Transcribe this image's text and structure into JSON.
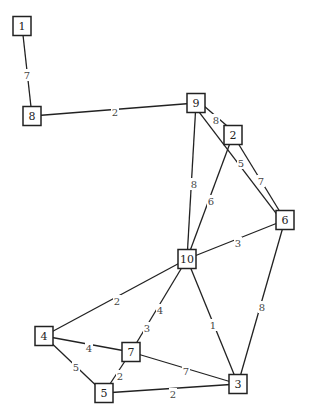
{
  "diagram": {
    "type": "weighted-undirected-graph",
    "nodes": [
      {
        "id": "1",
        "label": "1",
        "x": 22,
        "y": 26
      },
      {
        "id": "8",
        "label": "8",
        "x": 32,
        "y": 116
      },
      {
        "id": "9",
        "label": "9",
        "x": 196,
        "y": 103
      },
      {
        "id": "2",
        "label": "2",
        "x": 233,
        "y": 135
      },
      {
        "id": "6",
        "label": "6",
        "x": 285,
        "y": 220
      },
      {
        "id": "10",
        "label": "10",
        "x": 187,
        "y": 259
      },
      {
        "id": "4",
        "label": "4",
        "x": 44,
        "y": 336
      },
      {
        "id": "7",
        "label": "7",
        "x": 131,
        "y": 352
      },
      {
        "id": "5",
        "label": "5",
        "x": 104,
        "y": 393
      },
      {
        "id": "3",
        "label": "3",
        "x": 238,
        "y": 384
      }
    ],
    "edges": [
      {
        "from": "1",
        "to": "8",
        "weight": "7",
        "lx": 27,
        "ly": 75
      },
      {
        "from": "8",
        "to": "9",
        "weight": "2",
        "lx": 115,
        "ly": 112
      },
      {
        "from": "9",
        "to": "2",
        "weight": "8",
        "lx": 216,
        "ly": 120,
        "offset": -3
      },
      {
        "from": "9",
        "to": "6",
        "weight": "5",
        "lx": 241,
        "ly": 163,
        "offset": 3
      },
      {
        "from": "2",
        "to": "6",
        "weight": "7",
        "lx": 261,
        "ly": 181
      },
      {
        "from": "9",
        "to": "10",
        "weight": "8",
        "lx": 194,
        "ly": 184
      },
      {
        "from": "2",
        "to": "10",
        "weight": "6",
        "lx": 211,
        "ly": 201
      },
      {
        "from": "10",
        "to": "6",
        "weight": "3",
        "lx": 238,
        "ly": 243
      },
      {
        "from": "10",
        "to": "4",
        "weight": "2",
        "lx": 117,
        "ly": 301
      },
      {
        "from": "10",
        "to": "7",
        "weight": "4",
        "lx": 160,
        "ly": 310
      },
      {
        "from": "10",
        "to": "7",
        "weight": "3",
        "lx": 147,
        "ly": 328,
        "hidden_line": true
      },
      {
        "from": "10",
        "to": "3",
        "weight": "1",
        "lx": 213,
        "ly": 325
      },
      {
        "from": "6",
        "to": "3",
        "weight": "8",
        "lx": 262,
        "ly": 307
      },
      {
        "from": "4",
        "to": "7",
        "weight": "4",
        "lx": 89,
        "ly": 348
      },
      {
        "from": "4",
        "to": "5",
        "weight": "5",
        "lx": 76,
        "ly": 367
      },
      {
        "from": "7",
        "to": "5",
        "weight": "2",
        "lx": 120,
        "ly": 376
      },
      {
        "from": "7",
        "to": "3",
        "weight": "7",
        "lx": 186,
        "ly": 371
      },
      {
        "from": "5",
        "to": "3",
        "weight": "2",
        "lx": 173,
        "ly": 394
      }
    ]
  }
}
